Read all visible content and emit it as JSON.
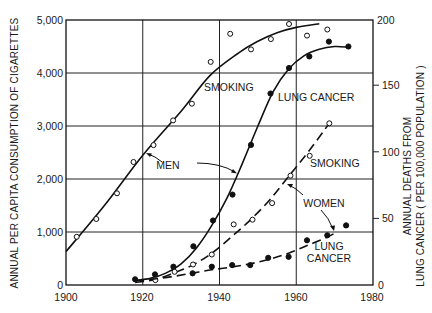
{
  "chart_data": {
    "type": "line",
    "title": "",
    "xlabel": "",
    "ylabel": "ANNUAL PER CAPITA CONSUMPTION OF CIGARETTES",
    "y2label_lines": [
      "ANNUAL DEATHS FROM",
      "LUNG CANCER ( PER 100,000 POPULATION )"
    ],
    "xlim": [
      1900,
      1980
    ],
    "ylim": [
      0,
      5000
    ],
    "y2lim": [
      0,
      200
    ],
    "grid": true,
    "x_ticks": [
      "1900",
      "1920",
      "1940",
      "1960",
      "1980"
    ],
    "y_ticks": [
      "0",
      "1,000",
      "2,000",
      "3,000",
      "4,000",
      "5,000"
    ],
    "y2_ticks": [
      "0",
      "50",
      "100",
      "150",
      "200"
    ],
    "series": [
      {
        "name": "Men smoking",
        "axis": "left",
        "style": "solid",
        "marker": "open",
        "points": [
          [
            1902.8,
            910
          ],
          [
            1907.9,
            1245
          ],
          [
            1913.3,
            1730
          ],
          [
            1917.6,
            2320
          ],
          [
            1922.8,
            2640
          ],
          [
            1927.9,
            3105
          ],
          [
            1932.8,
            3420
          ],
          [
            1937.7,
            4210
          ],
          [
            1942.8,
            4740
          ],
          [
            1948.2,
            4445
          ],
          [
            1953.4,
            4640
          ],
          [
            1958.1,
            4925
          ],
          [
            1962.8,
            4705
          ],
          [
            1968.1,
            4820
          ]
        ],
        "fit": [
          [
            1900,
            630
          ],
          [
            1910,
            1500
          ],
          [
            1920,
            2450
          ],
          [
            1930,
            3280
          ],
          [
            1937.5,
            3950
          ],
          [
            1945,
            4380
          ],
          [
            1950,
            4600
          ],
          [
            1955,
            4760
          ],
          [
            1960,
            4860
          ],
          [
            1966,
            4930
          ]
        ]
      },
      {
        "name": "Men lung cancer",
        "axis": "right",
        "style": "solid",
        "marker": "filled",
        "points": [
          [
            1918.0,
            4.3
          ],
          [
            1923.2,
            8.0
          ],
          [
            1928.0,
            13.8
          ],
          [
            1933.2,
            29.2
          ],
          [
            1938.3,
            48.7
          ],
          [
            1943.4,
            68.2
          ],
          [
            1948.2,
            105.7
          ],
          [
            1953.3,
            144.5
          ],
          [
            1958.1,
            163.8
          ],
          [
            1963.4,
            172.5
          ],
          [
            1968.5,
            183.7
          ],
          [
            1973.6,
            180.0
          ]
        ],
        "fit": [
          [
            1918,
            3.5
          ],
          [
            1922,
            5
          ],
          [
            1926,
            9
          ],
          [
            1930,
            16
          ],
          [
            1934,
            28
          ],
          [
            1938,
            45
          ],
          [
            1942,
            66
          ],
          [
            1946,
            92
          ],
          [
            1950,
            120
          ],
          [
            1954,
            146
          ],
          [
            1958,
            163
          ],
          [
            1962,
            173
          ],
          [
            1966,
            178
          ],
          [
            1970,
            180
          ],
          [
            1973.6,
            179.5
          ]
        ]
      },
      {
        "name": "Women smoking",
        "axis": "right",
        "style": "dashed",
        "marker": "open",
        "points": [
          [
            1923.3,
            3.7
          ],
          [
            1928.3,
            10.0
          ],
          [
            1933.1,
            15.5
          ],
          [
            1938.0,
            23.0
          ],
          [
            1943.7,
            45.7
          ],
          [
            1948.6,
            49.3
          ],
          [
            1953.7,
            61.8
          ],
          [
            1958.5,
            82.5
          ],
          [
            1963.5,
            97.5
          ],
          [
            1968.6,
            122.0
          ]
        ],
        "fit": [
          [
            1918,
            2
          ],
          [
            1923,
            4
          ],
          [
            1928,
            9
          ],
          [
            1933,
            15
          ],
          [
            1938,
            24
          ],
          [
            1943,
            36
          ],
          [
            1948,
            49
          ],
          [
            1953,
            64
          ],
          [
            1958,
            82
          ],
          [
            1963,
            100
          ],
          [
            1968.6,
            122
          ]
        ]
      },
      {
        "name": "Women lung cancer",
        "axis": "right",
        "style": "dashed",
        "marker": "filled",
        "points": [
          [
            1933.0,
            8.8
          ],
          [
            1938.0,
            13.8
          ],
          [
            1943.3,
            15.0
          ],
          [
            1948.0,
            15.0
          ],
          [
            1952.7,
            20.5
          ],
          [
            1958.0,
            21.3
          ],
          [
            1962.8,
            33.7
          ],
          [
            1968.1,
            37.5
          ],
          [
            1973.0,
            45.0
          ]
        ],
        "fit": [
          [
            1918,
            3
          ],
          [
            1923,
            4.5
          ],
          [
            1928,
            6.5
          ],
          [
            1933,
            9
          ],
          [
            1938,
            11.5
          ],
          [
            1943,
            13.5
          ],
          [
            1948,
            16
          ],
          [
            1953,
            19.5
          ],
          [
            1958,
            24
          ],
          [
            1963,
            30
          ],
          [
            1968,
            36
          ],
          [
            1970,
            39
          ]
        ]
      }
    ],
    "annotations": [
      {
        "text": "SMOKING",
        "series": "Men smoking"
      },
      {
        "text": "LUNG CANCER",
        "series": "Men lung cancer"
      },
      {
        "text": "MEN",
        "series": "Men"
      },
      {
        "text": "SMOKING",
        "series": "Women smoking"
      },
      {
        "text": "WOMEN",
        "series": "Women"
      },
      {
        "text": "LUNG",
        "series": "Women lung cancer"
      },
      {
        "text": "CANCER",
        "series": "Women lung cancer"
      }
    ]
  }
}
